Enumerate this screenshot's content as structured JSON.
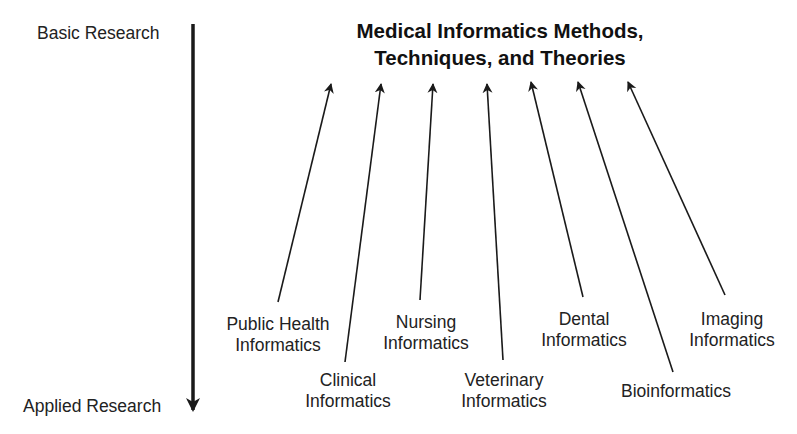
{
  "axis": {
    "top_label": "Basic Research",
    "bottom_label": "Applied Research",
    "direction": "down"
  },
  "title": {
    "line1": "Medical Informatics Methods,",
    "line2": "Techniques, and Theories"
  },
  "disciplines": [
    {
      "id": "public-health",
      "line1": "Public Health",
      "line2": "Informatics"
    },
    {
      "id": "clinical",
      "line1": "Clinical",
      "line2": "Informatics"
    },
    {
      "id": "nursing",
      "line1": "Nursing",
      "line2": "Informatics"
    },
    {
      "id": "veterinary",
      "line1": "Veterinary",
      "line2": "Informatics"
    },
    {
      "id": "dental",
      "line1": "Dental",
      "line2": "Informatics"
    },
    {
      "id": "bioinformatics",
      "line1": "Bioinformatics",
      "line2": ""
    },
    {
      "id": "imaging",
      "line1": "Imaging",
      "line2": "Informatics"
    }
  ],
  "colors": {
    "background": "#ffffff",
    "ink": "#1a1a1a"
  }
}
